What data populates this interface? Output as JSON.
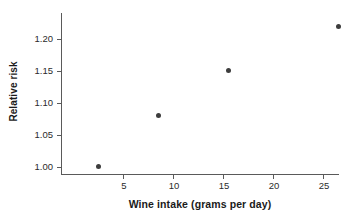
{
  "chart_data": {
    "type": "scatter",
    "title": "",
    "xlabel": "Wine intake (grams per day)",
    "ylabel": "Relative risk",
    "x": [
      2.5,
      8.5,
      15.5,
      26.5
    ],
    "y": [
      1.0,
      1.08,
      1.15,
      1.22
    ],
    "points": [
      {
        "x": 2.5,
        "y": 1.0
      },
      {
        "x": 8.5,
        "y": 1.08
      },
      {
        "x": 15.5,
        "y": 1.15
      },
      {
        "x": 26.5,
        "y": 1.22
      }
    ],
    "xlim": [
      -1.1,
      26.7
    ],
    "ylim": [
      0.9875,
      1.2406
    ],
    "xticks": [
      5,
      10,
      15,
      20,
      25
    ],
    "xtick_labels": [
      "5",
      "10",
      "15",
      "20",
      "25"
    ],
    "yticks": [
      1.0,
      1.05,
      1.1,
      1.15,
      1.2
    ],
    "ytick_labels": [
      "1.00",
      "1.05",
      "1.10",
      "1.15",
      "1.20"
    ],
    "grid": false,
    "legend": null,
    "marker_color": "#3d3d3d",
    "axis_color": "#5a5a5a",
    "background_color": "#ffffff"
  }
}
